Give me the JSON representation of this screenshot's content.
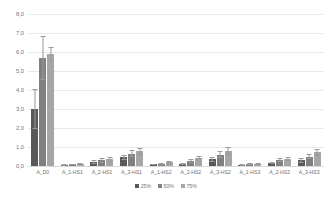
{
  "chart_data": {
    "type": "bar",
    "title": "",
    "xlabel": "",
    "ylabel": "",
    "ylim": [
      0,
      8
    ],
    "ytick_labels": [
      "0,0",
      "1,0",
      "2,0",
      "3,0",
      "4,0",
      "5,0",
      "6,0",
      "7,0",
      "8,0"
    ],
    "ytick_values": [
      0,
      1,
      2,
      3,
      4,
      5,
      6,
      7,
      8
    ],
    "grid": true,
    "legend_position": "bottom",
    "error_bars": true,
    "categories": [
      "A_D0",
      "A_1-HS1",
      "A_2-HS1",
      "A_3-HS1",
      "A_1-HS2",
      "A_2-HS2",
      "A_3-HS2",
      "A_1-HS3",
      "A_2-HS3",
      "A_3-HS3"
    ],
    "series": [
      {
        "name": "25%",
        "color": "#595959",
        "values": [
          3.0,
          0.05,
          0.2,
          0.45,
          0.08,
          0.12,
          0.35,
          0.07,
          0.15,
          0.3
        ],
        "errors": [
          1.05,
          0.04,
          0.1,
          0.15,
          0.05,
          0.06,
          0.12,
          0.05,
          0.07,
          0.12
        ]
      },
      {
        "name": "50%",
        "color": "#808080",
        "values": [
          5.7,
          0.08,
          0.3,
          0.65,
          0.12,
          0.28,
          0.6,
          0.09,
          0.3,
          0.5
        ],
        "errors": [
          1.15,
          0.04,
          0.12,
          0.18,
          0.06,
          0.1,
          0.2,
          0.05,
          0.1,
          0.15
        ]
      },
      {
        "name": "75%",
        "color": "#a6a6a6",
        "values": [
          5.9,
          0.1,
          0.35,
          0.78,
          0.2,
          0.42,
          0.8,
          0.12,
          0.38,
          0.72
        ],
        "errors": [
          0.35,
          0.05,
          0.12,
          0.18,
          0.08,
          0.12,
          0.22,
          0.06,
          0.12,
          0.2
        ]
      }
    ]
  },
  "legend": {
    "items": [
      {
        "label": "25%",
        "color": "#595959"
      },
      {
        "label": "50%",
        "color": "#808080"
      },
      {
        "label": "75%",
        "color": "#a6a6a6"
      }
    ]
  }
}
